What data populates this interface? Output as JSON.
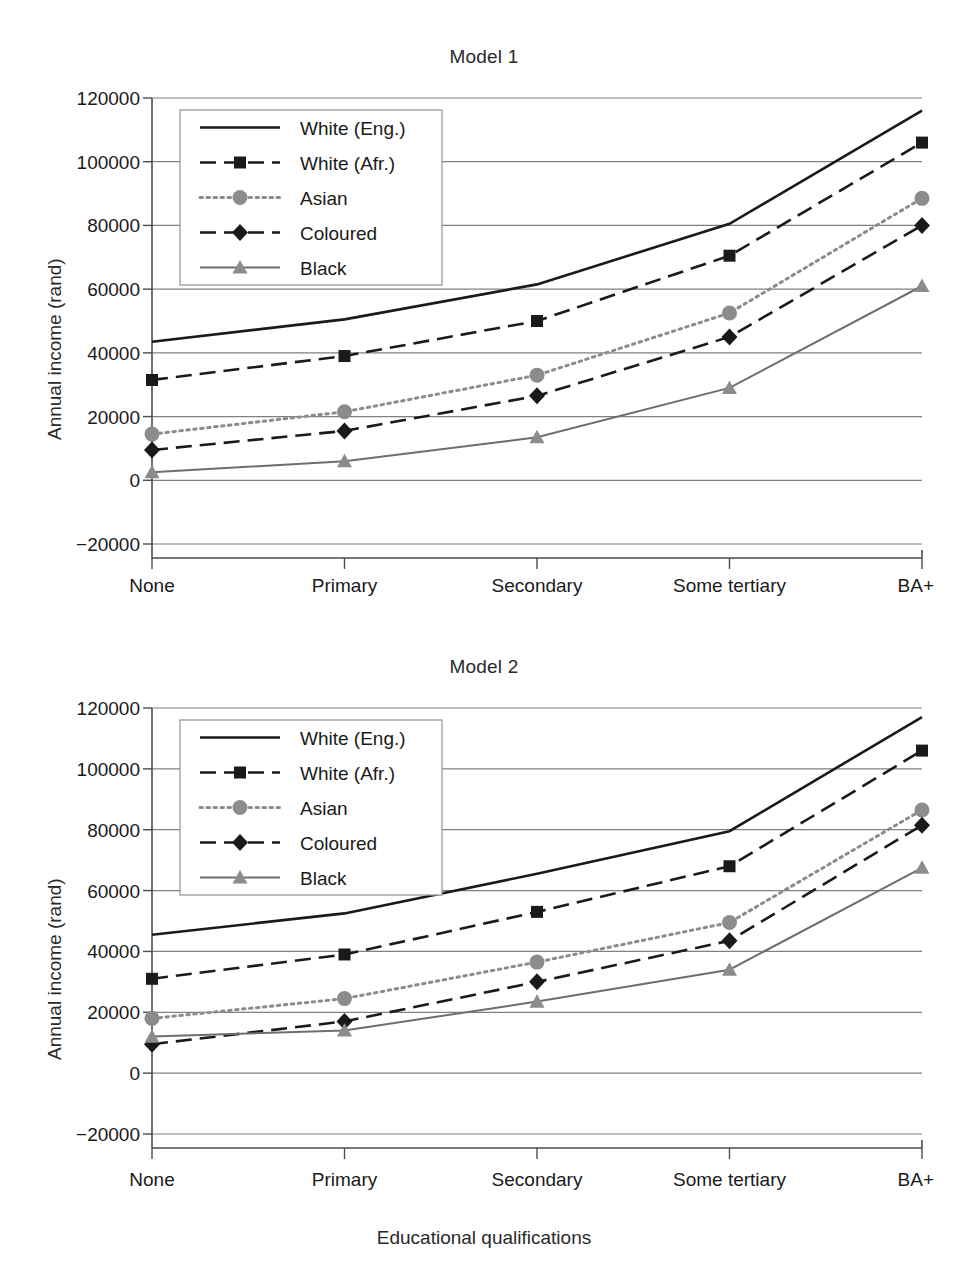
{
  "figure": {
    "xlabel": "Educational qualifications",
    "ylabel": "Annual income (rand)",
    "panels": [
      "Model 1",
      "Model 2"
    ]
  },
  "colors": {
    "black_line": "#1a1a1a",
    "grey_line": "#6e6e6e",
    "grey_marker": "#8c8c8c",
    "grid": "#808080",
    "axis": "#4d4d4d",
    "background": "#ffffff"
  },
  "legend": {
    "entries": [
      {
        "label": "White (Eng.)",
        "style": "solid",
        "color": "#1a1a1a",
        "marker": "none"
      },
      {
        "label": "White (Afr.)",
        "style": "dashed",
        "color": "#1a1a1a",
        "marker": "square"
      },
      {
        "label": "Asian",
        "style": "dotted",
        "color": "#8c8c8c",
        "marker": "circle"
      },
      {
        "label": "Coloured",
        "style": "dashed",
        "color": "#1a1a1a",
        "marker": "diamond"
      },
      {
        "label": "Black",
        "style": "solid",
        "color": "#6e6e6e",
        "marker": "triangle"
      }
    ]
  },
  "chart_data": [
    {
      "type": "line",
      "title": "Model 1",
      "xlabel": "Educational qualifications",
      "ylabel": "Annual income (rand)",
      "categories": [
        "None",
        "Primary",
        "Secondary",
        "Some tertiary",
        "BA+"
      ],
      "yticks": [
        -20000,
        0,
        20000,
        40000,
        60000,
        80000,
        100000,
        120000
      ],
      "ylim": [
        -20000,
        120000
      ],
      "grid": true,
      "legend_position": "upper left inside",
      "series": [
        {
          "name": "White (Eng.)",
          "values": [
            43500,
            50500,
            61500,
            80500,
            116000
          ]
        },
        {
          "name": "White (Afr.)",
          "values": [
            31500,
            39000,
            50000,
            70500,
            106000
          ]
        },
        {
          "name": "Asian",
          "values": [
            14500,
            21500,
            33000,
            52500,
            88500
          ]
        },
        {
          "name": "Coloured",
          "values": [
            9500,
            15500,
            26500,
            45000,
            80000
          ]
        },
        {
          "name": "Black",
          "values": [
            2500,
            6000,
            13500,
            29000,
            61000
          ]
        }
      ]
    },
    {
      "type": "line",
      "title": "Model 2",
      "xlabel": "Educational qualifications",
      "ylabel": "Annual income (rand)",
      "categories": [
        "None",
        "Primary",
        "Secondary",
        "Some tertiary",
        "BA+"
      ],
      "yticks": [
        -20000,
        0,
        20000,
        40000,
        60000,
        80000,
        100000,
        120000
      ],
      "ylim": [
        -20000,
        120000
      ],
      "grid": true,
      "legend_position": "upper left inside",
      "series": [
        {
          "name": "White (Eng.)",
          "values": [
            45500,
            52500,
            65500,
            79500,
            117000
          ]
        },
        {
          "name": "White (Afr.)",
          "values": [
            31000,
            39000,
            53000,
            68000,
            106000
          ]
        },
        {
          "name": "Asian",
          "values": [
            18000,
            24500,
            36500,
            49500,
            86500
          ]
        },
        {
          "name": "Coloured",
          "values": [
            9500,
            17000,
            30000,
            43500,
            81500
          ]
        },
        {
          "name": "Black",
          "values": [
            12000,
            14000,
            23500,
            34000,
            67500
          ]
        }
      ]
    }
  ]
}
